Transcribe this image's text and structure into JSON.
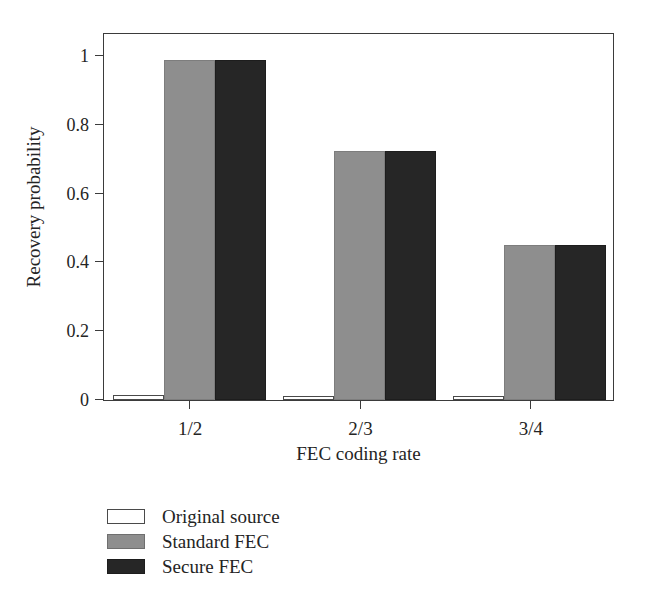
{
  "chart_data": {
    "type": "bar",
    "title": "",
    "xlabel": "FEC coding rate",
    "ylabel": "Recovery probability",
    "categories": [
      "1/2",
      "2/3",
      "3/4"
    ],
    "series": [
      {
        "name": "Original source",
        "color": "#ffffff",
        "values": [
          0.015,
          0.012,
          0.012
        ]
      },
      {
        "name": "Standard FEC",
        "color": "#8e8e8e",
        "values": [
          0.99,
          0.725,
          0.45
        ]
      },
      {
        "name": "Secure FEC",
        "color": "#262626",
        "values": [
          0.99,
          0.725,
          0.45
        ]
      }
    ],
    "ylim": [
      0,
      1.07
    ],
    "xlim": [
      0,
      3
    ],
    "ytick_labels": [
      "0",
      "0.2",
      "0.4",
      "0.6",
      "0.8",
      "1"
    ],
    "ytick_values": [
      0,
      0.2,
      0.4,
      0.6,
      0.8,
      1
    ],
    "grid": false,
    "legend_position": "below-left",
    "frame": true
  },
  "legend": {
    "items": [
      {
        "label": "Original source",
        "swatch": "series-original"
      },
      {
        "label": "Standard FEC",
        "swatch": "series-standard"
      },
      {
        "label": "Secure FEC",
        "swatch": "series-secure"
      }
    ]
  }
}
